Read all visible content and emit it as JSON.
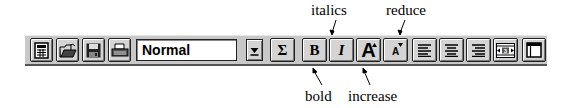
{
  "toolbar": {
    "buttons": [
      {
        "id": "new",
        "icon": "new-document-icon"
      },
      {
        "id": "open",
        "icon": "open-folder-icon"
      },
      {
        "id": "save",
        "icon": "save-disk-icon"
      },
      {
        "id": "print",
        "icon": "printer-icon"
      }
    ],
    "style_select": {
      "value": "Normal",
      "icon": "dropdown-arrow-icon"
    },
    "sum_label": "Σ",
    "bold_label": "B",
    "italic_label": "I",
    "increase_label": "A",
    "reduce_label": "A",
    "align_buttons": [
      "align-left-icon",
      "align-center-icon",
      "align-right-icon"
    ],
    "columns_label": "3",
    "frame_icon": "frame-window-icon"
  },
  "annotations": {
    "italics": "italics",
    "reduce": "reduce",
    "bold": "bold",
    "increase": "increase"
  }
}
